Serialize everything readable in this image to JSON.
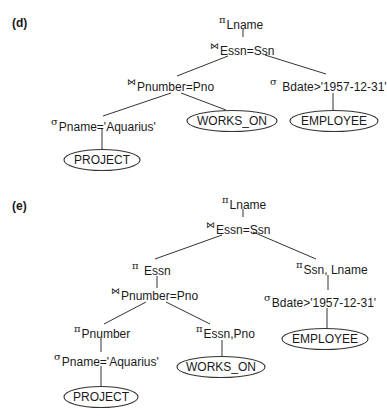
{
  "diagrams": {
    "d": {
      "label": "(d)",
      "nodes": {
        "root_project": {
          "symbol": "π",
          "subscript": "Lname"
        },
        "join_essn_ssn": {
          "symbol": "⋈",
          "subscript": "Essn=Ssn"
        },
        "join_pnumber_pno": {
          "symbol": "⋈",
          "subscript": "Pnumber=Pno"
        },
        "select_bdate": {
          "symbol": "σ",
          "subscript": "Bdate>'1957-12-31'"
        },
        "select_pname": {
          "symbol": "σ",
          "subscript": "Pname='Aquarius'"
        },
        "works_on": {
          "relation": "WORKS_ON"
        },
        "employee": {
          "relation": "EMPLOYEE"
        },
        "project": {
          "relation": "PROJECT"
        }
      }
    },
    "e": {
      "label": "(e)",
      "nodes": {
        "root_project": {
          "symbol": "π",
          "subscript": "Lname"
        },
        "join_essn_ssn": {
          "symbol": "⋈",
          "subscript": "Essn=Ssn"
        },
        "project_essn": {
          "symbol": "π",
          "subscript": "Essn"
        },
        "project_ssn_lname": {
          "symbol": "π",
          "subscript": "Ssn, Lname"
        },
        "join_pnumber_pno": {
          "symbol": "⋈",
          "subscript": "Pnumber=Pno"
        },
        "select_bdate": {
          "symbol": "σ",
          "subscript": "Bdate>'1957-12-31'"
        },
        "project_pnumber": {
          "symbol": "π",
          "subscript": "Pnumber"
        },
        "project_essn_pno": {
          "symbol": "π",
          "subscript": "Essn,Pno"
        },
        "select_pname": {
          "symbol": "σ",
          "subscript": "Pname='Aquarius'"
        },
        "works_on": {
          "relation": "WORKS_ON"
        },
        "employee": {
          "relation": "EMPLOYEE"
        },
        "project": {
          "relation": "PROJECT"
        }
      }
    }
  }
}
